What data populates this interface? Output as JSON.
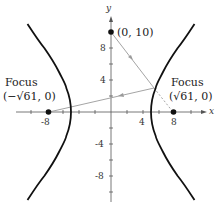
{
  "diagram": {
    "type": "hyperbola-reflection",
    "equation_implied": "x^2/25 - y^2/36 = 1",
    "axes": {
      "x_label": "x",
      "y_label": "y",
      "x_ticks_labeled": [
        "-8",
        "4",
        "8"
      ],
      "y_ticks_labeled": [
        "8",
        "4",
        "-4",
        "-8"
      ]
    },
    "points": {
      "top_point": {
        "label": "(0, 10)",
        "x": 0,
        "y": 10
      },
      "left_focus": {
        "title": "Focus",
        "coords": "(−√61, 0)"
      },
      "right_focus": {
        "title": "Focus",
        "coords": "(√61, 0)"
      }
    },
    "colors": {
      "curve": "#111111",
      "ray": "#9a9a9a",
      "axis": "#555555"
    }
  }
}
